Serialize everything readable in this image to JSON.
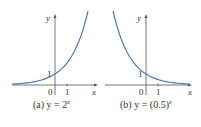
{
  "chart_data": [
    {
      "type": "line",
      "title": "(a) y = 2^x",
      "caption_prefix": "(a) y = 2",
      "caption_exponent": "x",
      "function": "y = 2^x",
      "xlabel": "x",
      "ylabel": "y",
      "x_ticks": [
        "0",
        "1"
      ],
      "y_ticks": [
        "1"
      ],
      "series": [
        {
          "name": "y = 2^x",
          "x": [
            -4,
            -3,
            -2,
            -1,
            0,
            1,
            2,
            2.8
          ],
          "values": [
            0.0625,
            0.125,
            0.25,
            0.5,
            1,
            2,
            4,
            6.96
          ]
        }
      ],
      "grid": false,
      "curve_color": "#4a7ab5"
    },
    {
      "type": "line",
      "title": "(b) y = (0.5)^x",
      "caption_prefix": "(b) y = (0.5)",
      "caption_exponent": "x",
      "function": "y = (0.5)^x",
      "xlabel": "x",
      "ylabel": "y",
      "x_ticks": [
        "0",
        "1"
      ],
      "y_ticks": [
        "1"
      ],
      "series": [
        {
          "name": "y = (0.5)^x",
          "x": [
            -2.8,
            -2,
            -1,
            0,
            1,
            2,
            3,
            4
          ],
          "values": [
            6.96,
            4,
            2,
            1,
            0.5,
            0.25,
            0.125,
            0.0625
          ]
        }
      ],
      "grid": false,
      "curve_color": "#4a7ab5"
    }
  ],
  "labels": {
    "a": {
      "y": "y",
      "x": "x",
      "zero": "0",
      "one_x": "1",
      "one_y": "1"
    },
    "b": {
      "y": "y",
      "x": "x",
      "zero": "0",
      "one_x": "1",
      "one_y": "1"
    }
  }
}
